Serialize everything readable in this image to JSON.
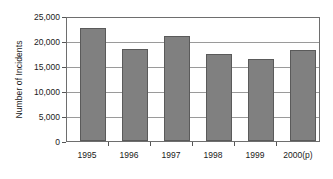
{
  "chart_data": {
    "type": "bar",
    "title": "",
    "subtitle": "",
    "xlabel": "",
    "ylabel": "Number of Incidents",
    "categories": [
      "1995",
      "1996",
      "1997",
      "1998",
      "1999",
      "2000(p)"
    ],
    "values": [
      23000,
      18700,
      21400,
      17700,
      16700,
      18500
    ],
    "series": [
      {
        "name": "Number of Incidents",
        "values": [
          23000,
          18700,
          21400,
          17700,
          16700,
          18500
        ]
      }
    ],
    "ylim": [
      0,
      25000
    ],
    "ytick_values": [
      0,
      5000,
      10000,
      15000,
      20000,
      25000
    ],
    "ytick_labels": [
      "0",
      "5,000",
      "10,000",
      "15,000",
      "20,000",
      "25,000"
    ],
    "grid": true,
    "grid_axis": "y",
    "legend": false,
    "legend_position": "none",
    "bar_color": "#808080",
    "bar_border_color": "#5a5a5a",
    "gridline_color": "#9a9a9a",
    "frame_color": "#6e6e6e",
    "background_color": "#ffffff",
    "text_color": "#1a1a1a",
    "annotations": []
  }
}
